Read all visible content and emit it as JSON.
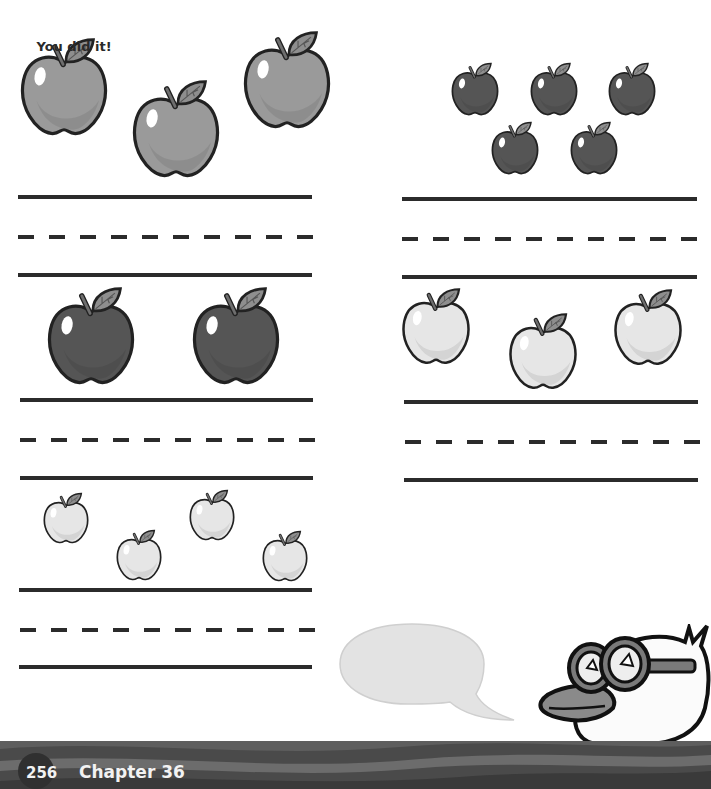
{
  "page": {
    "number": "256",
    "chapter": "Chapter 36"
  },
  "colors": {
    "line": "#2b2b2b",
    "apple_medium": "#9a9a9a",
    "apple_dark": "#555555",
    "apple_light": "#e6e6e6",
    "leaf": "#8e8e8e",
    "footer_dark": "#3a3a3a",
    "footer_light": "#6a6a6a"
  },
  "exercises": [
    {
      "id": "left-1",
      "apple_count": 3,
      "apple_shade": "medium"
    },
    {
      "id": "right-1",
      "apple_count": 5,
      "apple_shade": "dark"
    },
    {
      "id": "left-2",
      "apple_count": 2,
      "apple_shade": "dark"
    },
    {
      "id": "right-2",
      "apple_count": 3,
      "apple_shade": "light"
    },
    {
      "id": "left-3",
      "apple_count": 4,
      "apple_shade": "light"
    }
  ],
  "mascot": {
    "speech": "You did it!",
    "character": "duck-with-goggles"
  }
}
